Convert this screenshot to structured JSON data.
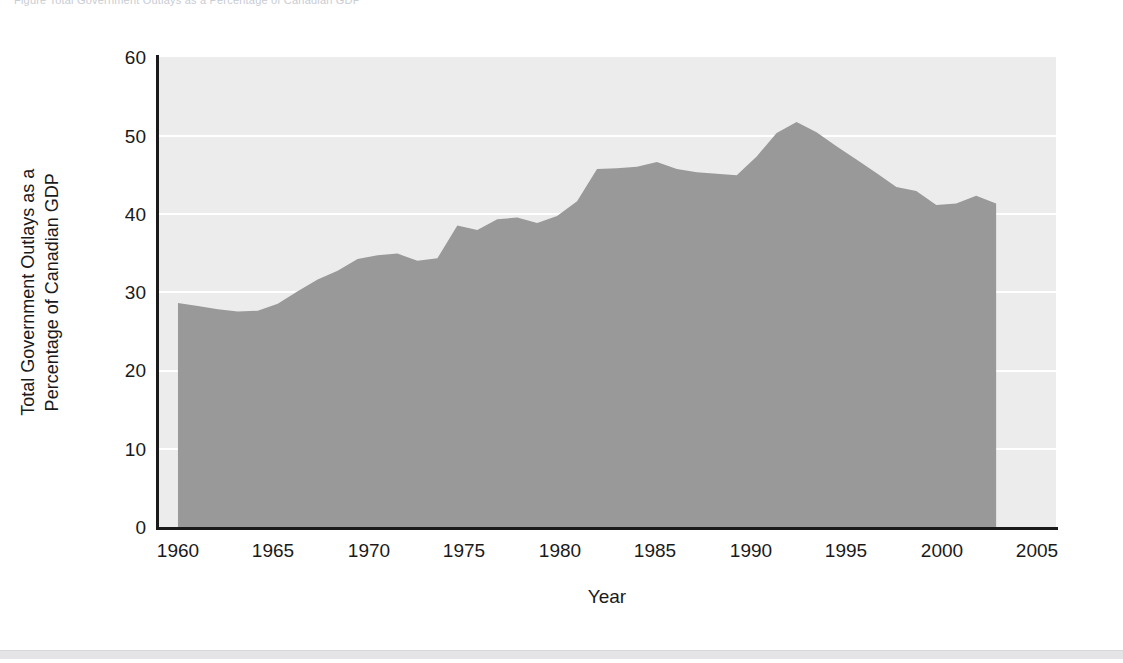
{
  "top_caption": "Figure     Total Government Outlays as a Percentage of Canadian GDP",
  "chart_data": {
    "type": "area",
    "title": "",
    "xlabel": "Year",
    "ylabel": "Total Government Outlays as a\nPercentage of Canadian GDP",
    "ylabel_line1": "Total Government Outlays as a",
    "ylabel_line2": "Percentage of Canadian GDP",
    "xlim": [
      1960,
      2005
    ],
    "ylim": [
      0,
      60
    ],
    "xticks": [
      1960,
      1965,
      1970,
      1975,
      1980,
      1985,
      1990,
      1995,
      2000,
      2005
    ],
    "yticks": [
      0,
      10,
      20,
      30,
      40,
      50,
      60
    ],
    "grid": "horizontal-white",
    "legend": "none",
    "fill_color": "#999999",
    "plot_background": "#ececec",
    "axis_color": "#1a1a1a",
    "x": [
      1961,
      1962,
      1963,
      1964,
      1965,
      1966,
      1967,
      1968,
      1969,
      1970,
      1971,
      1972,
      1973,
      1974,
      1975,
      1976,
      1977,
      1978,
      1979,
      1980,
      1981,
      1982,
      1983,
      1984,
      1985,
      1986,
      1987,
      1988,
      1989,
      1990,
      1991,
      1992,
      1993,
      1994,
      1995,
      1996,
      1997,
      1998,
      1999,
      2000,
      2001,
      2002
    ],
    "values": [
      28.6,
      28.2,
      27.8,
      27.5,
      27.6,
      28.5,
      30.1,
      31.6,
      32.7,
      34.2,
      34.7,
      34.9,
      34.0,
      34.3,
      38.5,
      37.9,
      39.3,
      39.5,
      38.8,
      39.7,
      41.6,
      45.7,
      45.8,
      46.0,
      46.6,
      45.7,
      45.3,
      45.1,
      44.9,
      47.3,
      50.3,
      51.7,
      50.4,
      48.6,
      46.9,
      45.2,
      43.4,
      42.9,
      41.1,
      41.3,
      42.3,
      41.3
    ]
  }
}
